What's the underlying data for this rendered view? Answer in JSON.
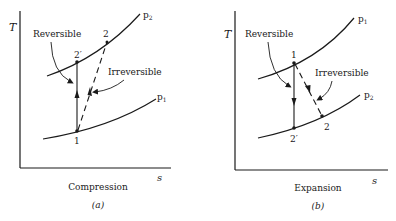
{
  "figure": {
    "panels": [
      {
        "id": "a",
        "caption": "(a)",
        "title": "Compression",
        "axes": {
          "y_label": "T",
          "x_label": "s"
        },
        "curves": [
          {
            "name": "p2",
            "label_main": "p",
            "label_sub": "2"
          },
          {
            "name": "p1",
            "label_main": "p",
            "label_sub": "1"
          }
        ],
        "points": {
          "start": "1",
          "reversible_end": "2′",
          "irreversible_end": "2"
        },
        "annotations": {
          "reversible": "Reversible",
          "irreversible": "Irreversible"
        }
      },
      {
        "id": "b",
        "caption": "(b)",
        "title": "Expansion",
        "axes": {
          "y_label": "T",
          "x_label": "s"
        },
        "curves": [
          {
            "name": "p1",
            "label_main": "p",
            "label_sub": "1"
          },
          {
            "name": "p2",
            "label_main": "p",
            "label_sub": "2"
          }
        ],
        "points": {
          "start": "1",
          "reversible_end": "2′",
          "irreversible_end": "2"
        },
        "annotations": {
          "reversible": "Reversible",
          "irreversible": "Irreversible"
        }
      }
    ],
    "colors": {
      "ink": "#1a1a1a",
      "background": "#ffffff"
    }
  }
}
